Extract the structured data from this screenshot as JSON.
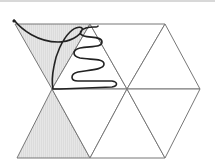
{
  "diagram": {
    "type": "triangular-grid-with-curve",
    "colors": {
      "background": "#ffffff",
      "grid_line": "#777777",
      "shaded_fill": "#dedede",
      "curve": "#222222",
      "top_border": "#d8d8d8"
    },
    "triangles": [
      {
        "id": "t1",
        "row": 1,
        "orientation": "down",
        "shaded": true,
        "points": "15,24 90,24 52,89"
      },
      {
        "id": "t2",
        "row": 1,
        "orientation": "up",
        "shaded": false,
        "points": "90,24 52,89 127,89"
      },
      {
        "id": "t3",
        "row": 1,
        "orientation": "down",
        "shaded": false,
        "points": "90,24 165,24 127,89"
      },
      {
        "id": "t4",
        "row": 1,
        "orientation": "up",
        "shaded": false,
        "points": "165,24 127,89 200,89"
      },
      {
        "id": "t5",
        "row": 2,
        "orientation": "up",
        "shaded": true,
        "points": "52,89 17,158 90,158"
      },
      {
        "id": "t6",
        "row": 2,
        "orientation": "down",
        "shaded": false,
        "points": "52,89 127,89 90,158"
      },
      {
        "id": "t7",
        "row": 2,
        "orientation": "up",
        "shaded": false,
        "points": "127,89 90,158 165,158"
      },
      {
        "id": "t8",
        "row": 2,
        "orientation": "down",
        "shaded": false,
        "points": "127,89 200,89 165,158"
      }
    ],
    "curve": {
      "start_marker": "14,21",
      "path": "M14,20 C22,30 38,42 58,42 C70,42 80,36 82,30 C84,26 76,26 70,32 C62,40 56,54 54,66 C52,76 52,84 53,89 L60,89 L112,87 C118,86 118,82 112,81 L78,81 C70,81 70,74 78,72 C88,70 104,70 104,64 C104,58 90,60 80,58 C72,56 72,50 80,48 C90,46 102,48 102,42 C102,36 90,38 84,36 C78,34 80,30 86,28 C92,26 98,28 98,26"
    }
  }
}
